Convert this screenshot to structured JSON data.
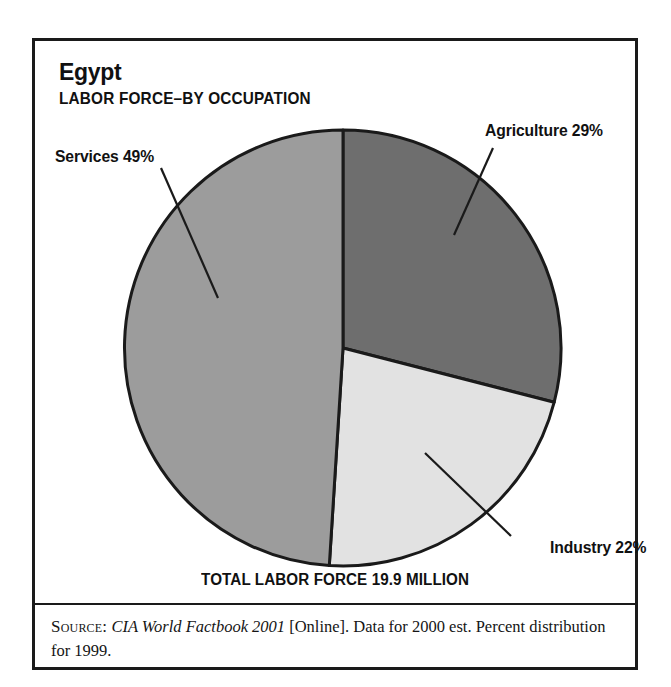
{
  "card": {
    "title": "Egypt",
    "subtitle": "LABOR FORCE–BY OCCUPATION",
    "total_caption": "TOTAL LABOR FORCE 19.9 MILLION",
    "source": {
      "label": "Source:",
      "work": "CIA World Factbook 2001",
      "rest": " [Online]. Data for 2000 est. Percent distribution for 1999."
    }
  },
  "labels": {
    "agriculture": "Agriculture 29%",
    "services": "Services 49%",
    "industry": "Industry 22%"
  },
  "colors": {
    "agriculture": "#6e6e6e",
    "services": "#9c9c9c",
    "industry": "#e2e2e2",
    "outline": "#1a1a1a",
    "background": "#ffffff"
  },
  "chart_data": {
    "type": "pie",
    "title": "Egypt",
    "subtitle": "LABOR FORCE–BY OCCUPATION",
    "categories": [
      "Agriculture",
      "Services",
      "Industry"
    ],
    "values": [
      29,
      49,
      22
    ],
    "unit": "percent",
    "total_label": "TOTAL LABOR FORCE 19.9 MILLION",
    "total_value": 19.9,
    "total_unit": "million workers",
    "start_angle_deg": 0,
    "direction": "clockwise",
    "slice_colors": [
      "#6e6e6e",
      "#9c9c9c",
      "#e2e2e2"
    ],
    "legend": "labels-with-leader-lines",
    "grid": false,
    "annotations": [
      "Agriculture 29%",
      "Services 49%",
      "Industry 22%"
    ]
  }
}
